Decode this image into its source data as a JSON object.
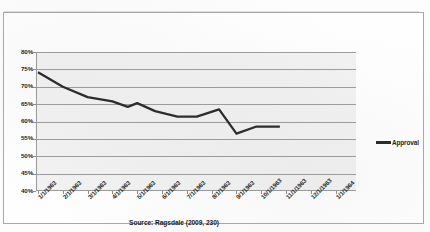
{
  "chart_data": {
    "type": "line",
    "title": "",
    "xlabel": "",
    "ylabel": "",
    "ylim": [
      40,
      80
    ],
    "ytick_step": 5,
    "grid": true,
    "legend_position": "right",
    "categories": [
      "1/1/1963",
      "2/1/1963",
      "3/1/1963",
      "4/1/1963",
      "5/1/1963",
      "6/1/1963",
      "7/1/1963",
      "8/1/1963",
      "9/1/1963",
      "10/1/1963",
      "11/1/1963",
      "12/1/1963",
      "1/1/1964"
    ],
    "ytick_labels": [
      "80%",
      "75%",
      "70%",
      "65%",
      "60%",
      "55%",
      "50%",
      "45%",
      "40%"
    ],
    "ytick_values": [
      80,
      75,
      70,
      65,
      60,
      55,
      50,
      45,
      40
    ],
    "series": [
      {
        "name": "Approval",
        "color": "#2a2a2a",
        "values": [
          74.2,
          70.0,
          67.0,
          65.8,
          64.2,
          65.3,
          63.0,
          61.4,
          61.4,
          63.5,
          56.5,
          58.5,
          58.5
        ],
        "value_x": [
          0,
          1,
          2,
          3,
          3.62,
          4.0,
          4.72,
          5.62,
          6.4,
          7.3,
          8.0,
          8.78,
          9.75
        ]
      }
    ],
    "annotations": {
      "source": "Source: Ragsdale (2009, 230)"
    }
  },
  "legend": {
    "entries": [
      {
        "label": "Approval",
        "color": "#2a2a2a"
      }
    ]
  },
  "caption": {
    "source": "Source: Ragsdale (2009, 230)"
  }
}
